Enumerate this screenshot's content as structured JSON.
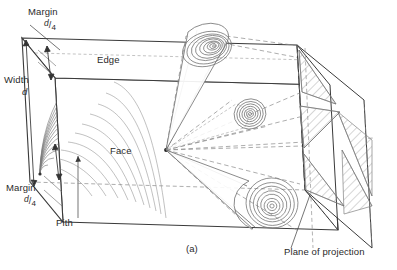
{
  "figure": {
    "caption": "(a)"
  },
  "labels": {
    "margin_top": "Margin",
    "margin_top_fraction_numerator": "d",
    "margin_top_fraction_denominator": "4",
    "width": "Width",
    "width_symbol": "d",
    "margin_bottom": "Margin",
    "margin_bottom_fraction_numerator": "d",
    "margin_bottom_fraction_denominator": "4",
    "pith": "Pith",
    "edge": "Edge",
    "face": "Face",
    "plane_of_projection": "Plane of projection"
  },
  "colors": {
    "line": "#3a3a3a",
    "dashed": "#7a7a7a",
    "ring": "#6b6b6b",
    "hatch": "#8a8a8a",
    "text": "#2a2a2a",
    "background": "#ffffff"
  },
  "geometry": {
    "knots": [
      {
        "name": "upper-knot",
        "cx": 207,
        "cy": 50,
        "rings": 9
      },
      {
        "name": "middle-knot",
        "cx": 250,
        "cy": 114,
        "rings": 7
      },
      {
        "name": "lower-knot",
        "cx": 272,
        "cy": 203,
        "rings": 8
      }
    ],
    "vertex": {
      "x": 166,
      "y": 150
    },
    "box": {
      "front_top_left": {
        "x": 55,
        "y": 78
      },
      "front_top_right": {
        "x": 330,
        "y": 85
      },
      "front_bottom_left": {
        "x": 63,
        "y": 222
      },
      "front_bottom_right": {
        "x": 338,
        "y": 230
      }
    }
  }
}
